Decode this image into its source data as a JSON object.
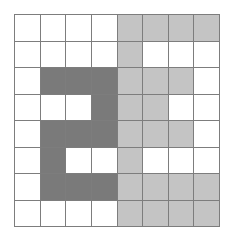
{
  "diagram": {
    "rows": 8,
    "cols": 8,
    "palette": {
      "0": "#ffffff",
      "1": "#7a7a7a",
      "2": "#c4c4c4"
    },
    "legend_semantics": {
      "0": "empty",
      "1": "dark-gray",
      "2": "light-gray"
    },
    "cells": [
      [
        0,
        0,
        0,
        0,
        2,
        2,
        2,
        2
      ],
      [
        0,
        0,
        0,
        0,
        2,
        0,
        0,
        0
      ],
      [
        0,
        1,
        1,
        1,
        2,
        2,
        2,
        0
      ],
      [
        0,
        0,
        0,
        1,
        2,
        2,
        0,
        0
      ],
      [
        0,
        1,
        1,
        1,
        2,
        2,
        2,
        0
      ],
      [
        0,
        1,
        0,
        0,
        2,
        0,
        0,
        0
      ],
      [
        0,
        1,
        1,
        1,
        2,
        2,
        2,
        2
      ],
      [
        0,
        0,
        0,
        0,
        2,
        2,
        2,
        2
      ]
    ]
  }
}
